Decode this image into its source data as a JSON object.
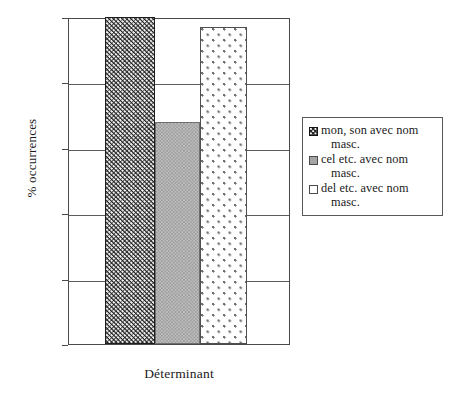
{
  "chart_data": {
    "type": "bar",
    "title": "",
    "xlabel": "Déterminant",
    "ylabel": "% occurrences",
    "categories": [
      "Déterminant"
    ],
    "ylim": [
      0,
      100
    ],
    "yticks": [
      0,
      20,
      40,
      60,
      80,
      100
    ],
    "ytick_labels": [
      "0",
      "20",
      "40",
      "60",
      "80",
      "100"
    ],
    "grid": true,
    "legend_position": "right",
    "series": [
      {
        "name": "mon, son avec nom masc.",
        "values": [
          100
        ],
        "fill": "black-with-white-dots",
        "color": "#242424"
      },
      {
        "name": "cel etc. avec nom masc.",
        "values": [
          68
        ],
        "fill": "solid-gray",
        "color": "#9e9e9e"
      },
      {
        "name": "del etc. avec nom masc.",
        "values": [
          97
        ],
        "fill": "white-with-gray-dots",
        "color": "#ffffff"
      }
    ]
  },
  "axes": {
    "y_label": "% occurrences",
    "x_label": "Déterminant",
    "ticks": [
      {
        "value": 100,
        "label": "100"
      },
      {
        "value": 80,
        "label": "80"
      },
      {
        "value": 60,
        "label": "60"
      },
      {
        "value": 40,
        "label": "40"
      },
      {
        "value": 20,
        "label": "20"
      },
      {
        "value": 0,
        "label": "0"
      }
    ]
  },
  "legend": {
    "entries": [
      {
        "line1": "mon, son avec nom",
        "line2": "masc.",
        "swatch": "pattern-dark-dotted"
      },
      {
        "line1": "cel etc. avec nom",
        "line2": "masc.",
        "swatch": "solid-gray"
      },
      {
        "line1": "del etc. avec nom",
        "line2": "masc.",
        "swatch": "white-dotted"
      }
    ]
  }
}
